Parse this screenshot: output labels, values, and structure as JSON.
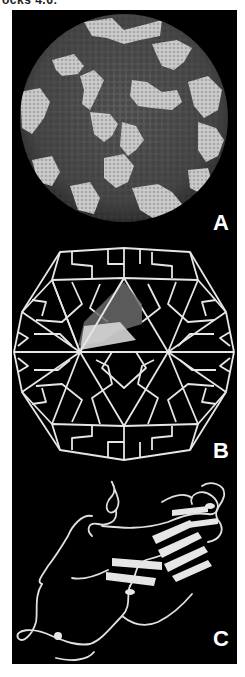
{
  "header": {
    "caption_fragment": "ocks 4.6:"
  },
  "figure": {
    "background": "#000000",
    "panels": [
      {
        "label": "A",
        "description": "space-filling model of icosahedral virus capsid",
        "surface_color": "#4e4e4e",
        "highlight_color": "#c9c9c9"
      },
      {
        "label": "B",
        "description": "icosahedral wireframe cage with one highlighted subunit",
        "line_color": "#e6e6e6",
        "subunit_dark": "#6a6a6a",
        "subunit_light": "#d8d8d8"
      },
      {
        "label": "C",
        "description": "ribbon diagram of capsid protein beta-barrel",
        "ribbon_color": "#e0e0e0"
      }
    ]
  }
}
